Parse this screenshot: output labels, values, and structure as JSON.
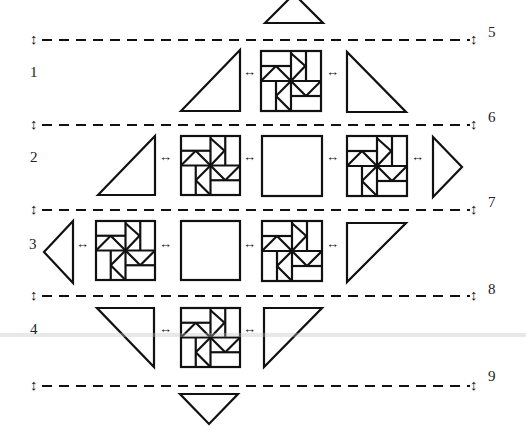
{
  "diagram": {
    "row_labels": [
      {
        "text": "1",
        "x": 30,
        "y": 73
      },
      {
        "text": "2",
        "x": 30,
        "y": 158
      },
      {
        "text": "3",
        "x": 29,
        "y": 245
      },
      {
        "text": "4",
        "x": 30,
        "y": 330
      }
    ],
    "seam_labels": [
      {
        "text": "5",
        "x": 488,
        "y": 33
      },
      {
        "text": "6",
        "x": 488,
        "y": 118
      },
      {
        "text": "7",
        "x": 488,
        "y": 203
      },
      {
        "text": "8",
        "x": 488,
        "y": 290
      },
      {
        "text": "9",
        "x": 488,
        "y": 377
      }
    ],
    "seam_lines_y": [
      40,
      125,
      210,
      296,
      386
    ],
    "join_arrow_symbol": "↔",
    "seam_arrow_symbol": "↕",
    "join_arrows": [
      {
        "x": 243,
        "y": 73
      },
      {
        "x": 326,
        "y": 73
      },
      {
        "x": 159,
        "y": 158
      },
      {
        "x": 243,
        "y": 158
      },
      {
        "x": 326,
        "y": 158
      },
      {
        "x": 411,
        "y": 158
      },
      {
        "x": 76,
        "y": 245
      },
      {
        "x": 159,
        "y": 245
      },
      {
        "x": 243,
        "y": 245
      },
      {
        "x": 326,
        "y": 245
      },
      {
        "x": 159,
        "y": 330
      },
      {
        "x": 243,
        "y": 330
      }
    ],
    "blocks": [
      {
        "type": "pinwheel",
        "x": 261,
        "y": 51,
        "size": 60,
        "row": 1
      },
      {
        "type": "pinwheel",
        "x": 181,
        "y": 136,
        "size": 59,
        "row": 2
      },
      {
        "type": "plain",
        "x": 262,
        "y": 136,
        "size": 60,
        "row": 2
      },
      {
        "type": "pinwheel",
        "x": 347,
        "y": 136,
        "size": 60,
        "row": 2
      },
      {
        "type": "pinwheel",
        "x": 96,
        "y": 221,
        "size": 59,
        "row": 3
      },
      {
        "type": "plain",
        "x": 181,
        "y": 221,
        "size": 59,
        "row": 3
      },
      {
        "type": "pinwheel",
        "x": 262,
        "y": 221,
        "size": 60,
        "row": 3
      },
      {
        "type": "pinwheel",
        "x": 181,
        "y": 308,
        "size": 59,
        "row": 4
      }
    ],
    "triangles": [
      {
        "name": "top-setting-triangle",
        "points": "265,23 294,-6 323,23"
      },
      {
        "name": "row1-left-triangle",
        "points": "181,111 240,50 240,111"
      },
      {
        "name": "row1-right-triangle",
        "points": "347,52 347,112 406,112"
      },
      {
        "name": "row2-left-triangle",
        "points": "98,195 155,136 155,195"
      },
      {
        "name": "row2-right-triangle",
        "points": "433,137 462,167 433,197"
      },
      {
        "name": "row3-left-triangle",
        "points": "73,221 44,252 73,283"
      },
      {
        "name": "row3-right-triangle",
        "points": "347,223 406,223 347,282"
      },
      {
        "name": "row4-left-triangle",
        "points": "97,308 154,308 154,367"
      },
      {
        "name": "row4-right-triangle",
        "points": "264,367 264,308 322,308"
      },
      {
        "name": "bottom-setting-triangle",
        "points": "180,394 238,394 209,424"
      }
    ]
  }
}
